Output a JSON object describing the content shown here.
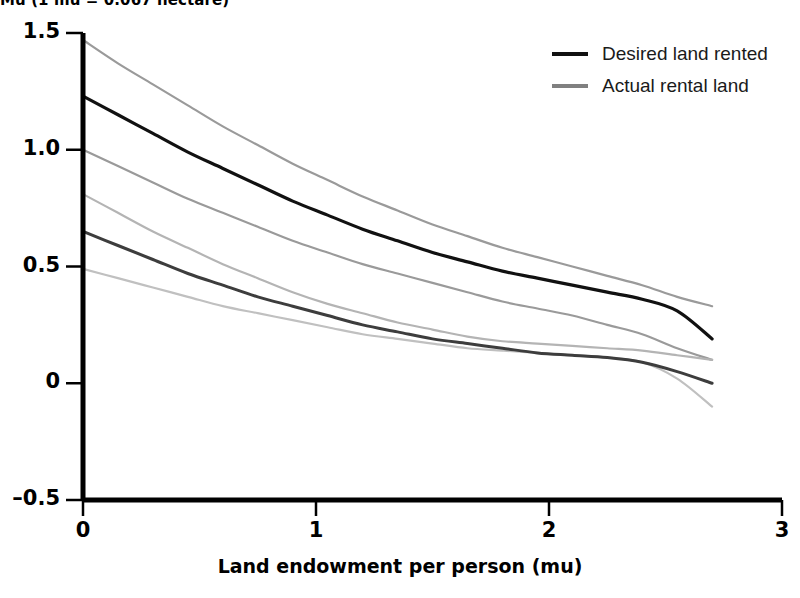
{
  "figure": {
    "heading": "Mu (1 mu = 0.067 hectare)"
  },
  "legend": {
    "position": "top-right",
    "items": [
      {
        "label": "Desired land rented",
        "color": "#111111",
        "name": "legend-desired"
      },
      {
        "label": "Actual rental land",
        "color": "#808080",
        "name": "legend-actual"
      }
    ]
  },
  "chart_data": {
    "type": "line",
    "title": "Mu (1 mu = 0.067 hectare)",
    "xlabel": "Land endowment per person (mu)",
    "ylabel": "",
    "xlim": [
      0,
      3
    ],
    "ylim": [
      -0.5,
      1.5
    ],
    "xticks": [
      "0",
      "1",
      "2",
      "3"
    ],
    "xtick_values": [
      0,
      1,
      2,
      3
    ],
    "yticks": [
      "1.5",
      "1.0",
      "0.5",
      "0",
      "-0.5"
    ],
    "ytick_values": [
      1.5,
      1.0,
      0.5,
      0,
      -0.5
    ],
    "grid": false,
    "x": [
      0,
      0.15,
      0.3,
      0.45,
      0.6,
      0.75,
      0.9,
      1.05,
      1.2,
      1.35,
      1.5,
      1.65,
      1.8,
      1.95,
      2.1,
      2.25,
      2.4,
      2.55,
      2.7
    ],
    "series": [
      {
        "name": "Desired land rented",
        "role": "fit",
        "color": "#111111",
        "width": 3.2,
        "values": [
          1.23,
          1.15,
          1.07,
          0.99,
          0.92,
          0.85,
          0.78,
          0.72,
          0.66,
          0.61,
          0.56,
          0.52,
          0.48,
          0.45,
          0.42,
          0.39,
          0.36,
          0.31,
          0.19
        ]
      },
      {
        "name": "Desired land rented upper bound",
        "role": "confidence-upper",
        "color": "#9a9a9a",
        "width": 2.2,
        "values": [
          1.47,
          1.37,
          1.28,
          1.19,
          1.1,
          1.02,
          0.94,
          0.87,
          0.8,
          0.74,
          0.68,
          0.63,
          0.58,
          0.54,
          0.5,
          0.46,
          0.42,
          0.37,
          0.33
        ]
      },
      {
        "name": "Desired land rented lower bound",
        "role": "confidence-lower",
        "color": "#9a9a9a",
        "width": 2.2,
        "values": [
          1.0,
          0.93,
          0.86,
          0.79,
          0.73,
          0.67,
          0.61,
          0.56,
          0.51,
          0.47,
          0.43,
          0.39,
          0.35,
          0.32,
          0.29,
          0.25,
          0.21,
          0.15,
          0.1
        ]
      },
      {
        "name": "Actual rental land",
        "role": "fit",
        "color": "#3d3d3d",
        "width": 3.0,
        "values": [
          0.65,
          0.59,
          0.53,
          0.47,
          0.42,
          0.37,
          0.33,
          0.29,
          0.25,
          0.22,
          0.19,
          0.17,
          0.15,
          0.13,
          0.12,
          0.11,
          0.09,
          0.05,
          0.0
        ]
      },
      {
        "name": "Actual rental land upper bound",
        "role": "confidence-upper",
        "color": "#b4b4b4",
        "width": 2.2,
        "values": [
          0.81,
          0.73,
          0.65,
          0.58,
          0.51,
          0.45,
          0.39,
          0.34,
          0.3,
          0.26,
          0.23,
          0.2,
          0.18,
          0.17,
          0.16,
          0.15,
          0.14,
          0.12,
          0.1
        ]
      },
      {
        "name": "Actual rental land lower bound",
        "role": "confidence-lower",
        "color": "#c0c0c0",
        "width": 2.2,
        "values": [
          0.49,
          0.45,
          0.41,
          0.37,
          0.33,
          0.3,
          0.27,
          0.24,
          0.21,
          0.19,
          0.17,
          0.15,
          0.14,
          0.13,
          0.12,
          0.11,
          0.09,
          0.02,
          -0.1
        ]
      }
    ],
    "annotations": [
      {
        "text": "Confidence bounds of the actual rental land curve cross near x = 2.6"
      }
    ]
  },
  "axes": {
    "x_title": "Land endowment per person (mu)",
    "x_tick_labels": [
      "0",
      "1",
      "2",
      "3"
    ],
    "y_tick_labels": [
      "1.5",
      "1.0",
      "0.5",
      "0",
      "-0.5"
    ]
  }
}
